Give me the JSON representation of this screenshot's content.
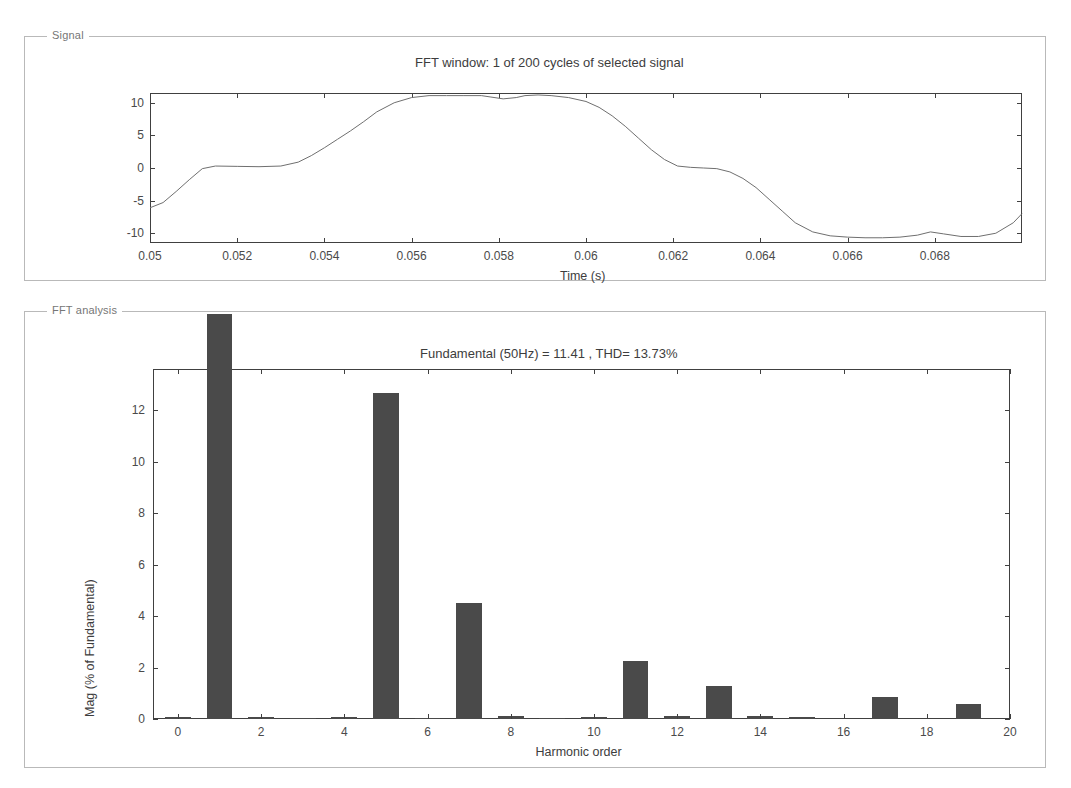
{
  "signal_panel": {
    "label": "Signal",
    "title": "FFT window: 1 of 200 cycles of selected signal",
    "xlabel": "Time (s)",
    "xticks": [
      "0.05",
      "0.052",
      "0.054",
      "0.056",
      "0.058",
      "0.06",
      "0.062",
      "0.064",
      "0.066",
      "0.068"
    ],
    "yticks": [
      "10",
      "5",
      "0",
      "-5",
      "-10"
    ]
  },
  "fft_panel": {
    "label": "FFT analysis",
    "title": "Fundamental (50Hz) = 11.41 , THD= 13.73%",
    "xlabel": "Harmonic order",
    "ylabel": "Mag (% of Fundamental)",
    "xticks": [
      "0",
      "2",
      "4",
      "6",
      "8",
      "10",
      "12",
      "14",
      "16",
      "18",
      "20"
    ],
    "yticks": [
      "0",
      "2",
      "4",
      "6",
      "8",
      "10",
      "12"
    ]
  },
  "colors": {
    "bar": "#4a4a4a",
    "axis": "#404040",
    "panel_border": "#b9b9b9",
    "text": "#3d3d3d",
    "trace": "#6f6f6f"
  },
  "chart_data": [
    {
      "type": "line",
      "title": "FFT window: 1 of 200 cycles of selected signal",
      "xlabel": "Time (s)",
      "ylabel": "",
      "xlim": [
        0.05,
        0.07
      ],
      "ylim": [
        -11.5,
        11.5
      ],
      "xticks": [
        0.05,
        0.052,
        0.054,
        0.056,
        0.058,
        0.06,
        0.062,
        0.064,
        0.066,
        0.068
      ],
      "yticks": [
        -10,
        -5,
        0,
        5,
        10
      ],
      "grid": false,
      "legend": "none",
      "series": [
        {
          "name": "selected signal",
          "x": [
            0.05,
            0.0503,
            0.0506,
            0.0509,
            0.0512,
            0.0515,
            0.052,
            0.0525,
            0.053,
            0.0534,
            0.0537,
            0.054,
            0.0543,
            0.0546,
            0.0549,
            0.0552,
            0.0556,
            0.056,
            0.0564,
            0.0568,
            0.0572,
            0.0576,
            0.0578,
            0.0581,
            0.0584,
            0.0586,
            0.0589,
            0.0592,
            0.0596,
            0.06,
            0.0603,
            0.0606,
            0.0609,
            0.0612,
            0.0615,
            0.0618,
            0.0621,
            0.0624,
            0.0627,
            0.063,
            0.0633,
            0.0636,
            0.0639,
            0.0642,
            0.0645,
            0.0648,
            0.0652,
            0.0656,
            0.066,
            0.0664,
            0.0668,
            0.0672,
            0.0676,
            0.0679,
            0.0682,
            0.0686,
            0.069,
            0.0694,
            0.0698,
            0.07
          ],
          "y": [
            -6.1,
            -5.3,
            -3.6,
            -1.8,
            -0.1,
            0.3,
            0.25,
            0.2,
            0.3,
            0.9,
            1.9,
            3.1,
            4.4,
            5.7,
            7.1,
            8.6,
            10.0,
            10.8,
            11.1,
            11.1,
            11.1,
            11.1,
            10.9,
            10.6,
            10.8,
            11.1,
            11.2,
            11.1,
            10.8,
            10.2,
            9.3,
            8.0,
            6.4,
            4.6,
            2.8,
            1.3,
            0.3,
            0.1,
            0.0,
            -0.1,
            -0.6,
            -1.6,
            -3.0,
            -4.8,
            -6.6,
            -8.4,
            -9.8,
            -10.4,
            -10.6,
            -10.7,
            -10.7,
            -10.6,
            -10.3,
            -9.8,
            -10.1,
            -10.5,
            -10.5,
            -10.0,
            -8.4,
            -7.0
          ]
        }
      ]
    },
    {
      "type": "bar",
      "title": "Fundamental (50Hz) = 11.41 , THD= 13.73%",
      "xlabel": "Harmonic order",
      "ylabel": "Mag (% of Fundamental)",
      "xlim": [
        -0.6,
        20
      ],
      "ylim": [
        0,
        13.6
      ],
      "xticks": [
        0,
        2,
        4,
        6,
        8,
        10,
        12,
        14,
        16,
        18,
        20
      ],
      "yticks": [
        0,
        2,
        4,
        6,
        8,
        10,
        12
      ],
      "grid": false,
      "legend": "none",
      "note": "fundamental bar at harmonic 1 is 100% and is clipped above the axes box",
      "categories": [
        0,
        1,
        2,
        3,
        4,
        5,
        6,
        7,
        8,
        9,
        10,
        11,
        12,
        13,
        14,
        15,
        16,
        17,
        18,
        19,
        20
      ],
      "values": [
        0.07,
        100.0,
        0.07,
        0.05,
        0.06,
        12.65,
        0.05,
        4.52,
        0.1,
        0.05,
        0.08,
        2.25,
        0.1,
        1.3,
        0.1,
        0.06,
        0.0,
        0.85,
        0.0,
        0.6,
        0.0
      ],
      "fundamental": 11.41,
      "fundamental_freq_hz": 50,
      "thd_percent": 13.73
    }
  ]
}
